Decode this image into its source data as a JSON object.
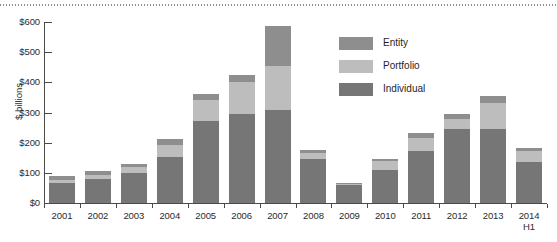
{
  "chart_data": {
    "type": "bar",
    "stacked": true,
    "title": "",
    "subtitle": "",
    "xlabel": "",
    "ylabel": "$ billions",
    "ylim": [
      0,
      600
    ],
    "ytick_labels": [
      "$0",
      "$100",
      "$200",
      "$300",
      "$400",
      "$500",
      "$600"
    ],
    "ytick_values": [
      0,
      100,
      200,
      300,
      400,
      500,
      600
    ],
    "grid": false,
    "legend_position": "upper-center-right",
    "categories": [
      "2001",
      "2002",
      "2003",
      "2004",
      "2005",
      "2006",
      "2007",
      "2008",
      "2009",
      "2010",
      "2011",
      "2012",
      "2013",
      "2014 H1"
    ],
    "category_sublabels": [
      "",
      "",
      "",
      "",
      "",
      "",
      "",
      "",
      "",
      "",
      "",
      "",
      "",
      "H1"
    ],
    "series": [
      {
        "name": "Individual",
        "color": "#767676",
        "values": [
          65,
          78,
          100,
          153,
          272,
          295,
          308,
          145,
          60,
          110,
          172,
          245,
          247,
          135
        ]
      },
      {
        "name": "Portfolio",
        "color": "#bdbdbd",
        "values": [
          12,
          15,
          20,
          40,
          68,
          105,
          146,
          22,
          5,
          30,
          45,
          35,
          85,
          38
        ]
      },
      {
        "name": "Entity",
        "color": "#8e8e8e",
        "values": [
          12,
          12,
          10,
          20,
          20,
          25,
          133,
          10,
          3,
          7,
          15,
          15,
          22,
          10
        ]
      }
    ],
    "totals": [
      89,
      105,
      130,
      213,
      360,
      425,
      587,
      177,
      68,
      147,
      232,
      295,
      354,
      183
    ]
  },
  "legend": {
    "items": [
      {
        "label": "Entity",
        "color": "#8e8e8e"
      },
      {
        "label": "Portfolio",
        "color": "#bdbdbd"
      },
      {
        "label": "Individual",
        "color": "#767676"
      }
    ]
  },
  "axes": {
    "y_title": "$ billions"
  }
}
